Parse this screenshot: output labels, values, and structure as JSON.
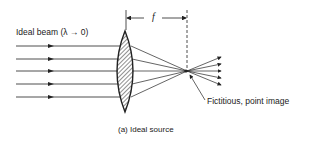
{
  "figure": {
    "beam_label": "Ideal beam (λ → 0)",
    "focal_label": "f",
    "image_label": "Fictitious, point image",
    "caption": "(a)  Ideal source"
  },
  "geometry": {
    "lens_x": 125,
    "focal_x": 187,
    "focal_y": 71,
    "ray_ys": [
      46,
      59,
      71,
      84,
      97
    ],
    "ink": "#222222"
  }
}
